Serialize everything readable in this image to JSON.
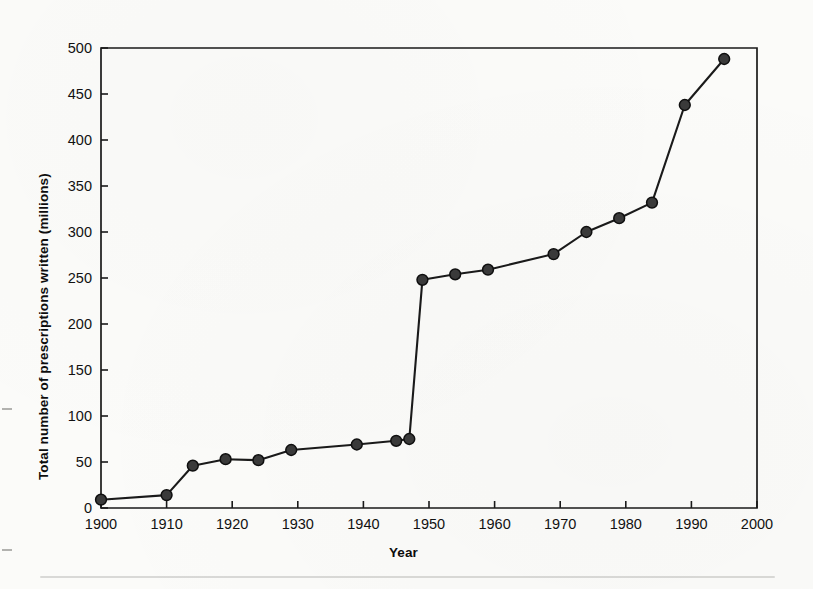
{
  "chart_data": {
    "type": "line",
    "title": "",
    "subtitle": "",
    "xlabel": "Year",
    "ylabel": "Total number of prescriptions written (millions)",
    "xlim": [
      1900,
      2000
    ],
    "ylim": [
      0,
      500
    ],
    "xticks": [
      1900,
      1910,
      1920,
      1930,
      1940,
      1950,
      1960,
      1970,
      1980,
      1990,
      2000
    ],
    "yticks": [
      0,
      50,
      100,
      150,
      200,
      250,
      300,
      350,
      400,
      450,
      500
    ],
    "xtick_labels": [
      "1900",
      "1910",
      "1920",
      "1930",
      "1940",
      "1950",
      "1960",
      "1970",
      "1980",
      "1990",
      "2000"
    ],
    "ytick_labels": [
      "0",
      "50",
      "100",
      "150",
      "200",
      "250",
      "300",
      "350",
      "400",
      "450",
      "500"
    ],
    "grid": false,
    "legend": null,
    "legend_position": "none",
    "marker": "filled-circle",
    "line_color": "#1a1a1a",
    "marker_color": "#3a3a3a",
    "series": [
      {
        "name": "Total prescriptions written",
        "x": [
          1900,
          1910,
          1914,
          1919,
          1924,
          1929,
          1939,
          1945,
          1947,
          1949,
          1954,
          1959,
          1969,
          1974,
          1979,
          1984,
          1989,
          1995
        ],
        "values": [
          9,
          14,
          46,
          53,
          52,
          63,
          69,
          73,
          75,
          248,
          254,
          259,
          276,
          300,
          315,
          332,
          438,
          488
        ]
      }
    ],
    "annotations": []
  },
  "figure": {
    "background_color": "#fbfbf9",
    "frame_color": "#1a1a1a",
    "text_color": "#111111"
  }
}
